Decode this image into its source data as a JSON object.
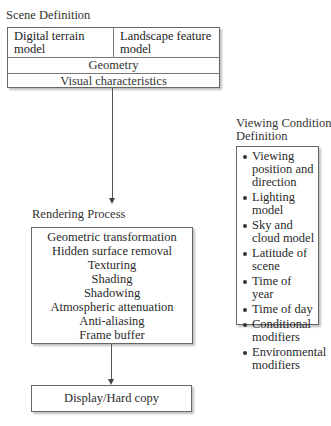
{
  "scene_definition": {
    "title": "Scene Definition",
    "models": {
      "left": "Digital terrain model",
      "right": "Landscape feature model"
    },
    "rows": [
      "Geometry",
      "Visual characteristics"
    ]
  },
  "rendering_process": {
    "title": "Rendering Process",
    "steps": [
      "Geometric transformation",
      "Hidden surface removal",
      "Texturing",
      "Shading",
      "Shadowing",
      "Atmospheric attenuation",
      "Anti-aliasing",
      "Frame buffer"
    ]
  },
  "output": {
    "label": "Display/Hard copy"
  },
  "viewing_condition_definition": {
    "title_line1": "Viewing Condition",
    "title_line2": "Definition",
    "items": [
      "Viewing position and direction",
      "Lighting model",
      "Sky and cloud model",
      "Latitude of scene",
      "Time of year",
      "Time of day",
      "Conditional modifiers",
      "Environmental modifiers"
    ]
  }
}
